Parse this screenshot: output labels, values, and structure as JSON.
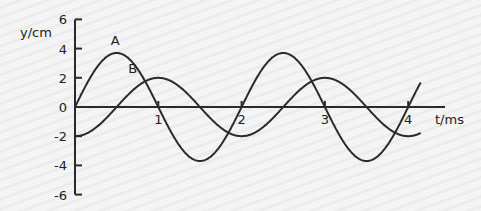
{
  "chart_data": {
    "type": "line",
    "title": "",
    "xlabel": "t/ms",
    "ylabel": "y/cm",
    "xlim": [
      0,
      4.15
    ],
    "ylim": [
      -6,
      6
    ],
    "x_ticks": [
      "1",
      "2",
      "3",
      "4"
    ],
    "y_ticks": [
      "6",
      "4",
      "2",
      "0",
      "-2",
      "-4",
      "-6"
    ],
    "grid": false,
    "series": [
      {
        "name": "A",
        "function": "3.7*sin(pi*t)",
        "amplitude": 3.7,
        "period_ms": 2,
        "x": [
          0,
          0.5,
          1,
          1.5,
          2,
          2.5,
          3,
          3.5,
          4,
          4.15
        ],
        "values": [
          0,
          3.7,
          0,
          -3.7,
          0,
          3.7,
          0,
          -3.7,
          0,
          1.7
        ]
      },
      {
        "name": "B",
        "function": "-2*cos(pi*t)",
        "amplitude": 2,
        "period_ms": 2,
        "x": [
          0,
          0.5,
          1,
          1.5,
          2,
          2.5,
          3,
          3.5,
          4,
          4.15
        ],
        "values": [
          -2,
          0,
          2,
          0,
          -2,
          0,
          2,
          0,
          -2,
          -1.8
        ]
      }
    ]
  },
  "labels": {
    "ylabel": "y/cm",
    "xlabel": "t/ms",
    "a": "A",
    "b": "B"
  }
}
